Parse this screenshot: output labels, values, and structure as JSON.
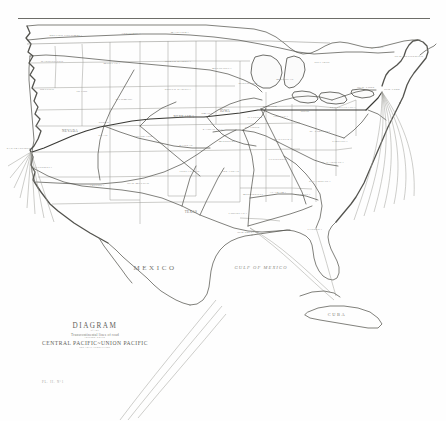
{
  "document": {
    "kind": "scanned-map-plate",
    "top_rule": true
  },
  "title_block": {
    "heading": "DIAGRAM",
    "ornament": "of the",
    "subtitle": "Transcontinental lines of road",
    "ornament2": "through which",
    "roads": "CENTRAL PACIFIC~UNION PACIFIC",
    "footnote": "and their connections"
  },
  "plate_mark": "PL. II. N°1",
  "water_labels": [
    {
      "text": "GULF OF MEXICO",
      "x": 261,
      "y": 269
    },
    {
      "text": "CUBA",
      "x": 337,
      "y": 316
    }
  ],
  "land_labels": [
    {
      "text": "MEXICO",
      "x": 155,
      "y": 270
    }
  ],
  "regions": [
    {
      "name": "BRITISH COLUMBIA",
      "x": 66,
      "y": 36
    },
    {
      "name": "ASSINIBOIA",
      "x": 131,
      "y": 34
    },
    {
      "name": "MANITOBA",
      "x": 180,
      "y": 33
    },
    {
      "name": "ONTARIO",
      "x": 322,
      "y": 63
    },
    {
      "name": "QUEBEC",
      "x": 377,
      "y": 48
    },
    {
      "name": "NEW BRUNSWICK",
      "x": 409,
      "y": 57
    },
    {
      "name": "WASHINGTON",
      "x": 52,
      "y": 62
    },
    {
      "name": "MONTANA",
      "x": 112,
      "y": 64
    },
    {
      "name": "NORTH DAKOTA",
      "x": 178,
      "y": 62
    },
    {
      "name": "MINNESOTA",
      "x": 222,
      "y": 69
    },
    {
      "name": "OREGON",
      "x": 47,
      "y": 90
    },
    {
      "name": "IDAHO",
      "x": 82,
      "y": 92
    },
    {
      "name": "WYOMING",
      "x": 124,
      "y": 100
    },
    {
      "name": "SOUTH DAKOTA",
      "x": 178,
      "y": 90
    },
    {
      "name": "WISCONSIN",
      "x": 248,
      "y": 84
    },
    {
      "name": "MICHIGAN",
      "x": 285,
      "y": 80
    },
    {
      "name": "NEW YORK",
      "x": 366,
      "y": 88
    },
    {
      "name": "NEVADA",
      "x": 70,
      "y": 132
    },
    {
      "name": "UTAH",
      "x": 103,
      "y": 136
    },
    {
      "name": "COLORADO",
      "x": 143,
      "y": 137
    },
    {
      "name": "NEBRASKA",
      "x": 184,
      "y": 118
    },
    {
      "name": "IOWA",
      "x": 225,
      "y": 112
    },
    {
      "name": "ILLINOIS",
      "x": 255,
      "y": 118
    },
    {
      "name": "INDIANA",
      "x": 281,
      "y": 117
    },
    {
      "name": "OHIO",
      "x": 305,
      "y": 112
    },
    {
      "name": "PENNSYLVANIA",
      "x": 343,
      "y": 108
    },
    {
      "name": "CALIFORNIA",
      "x": 42,
      "y": 168
    },
    {
      "name": "KANSAS",
      "x": 186,
      "y": 146
    },
    {
      "name": "MISSOURI",
      "x": 227,
      "y": 142
    },
    {
      "name": "KENTUCKY",
      "x": 283,
      "y": 140
    },
    {
      "name": "W. VIRGINIA",
      "x": 320,
      "y": 132
    },
    {
      "name": "VIRGINIA",
      "x": 340,
      "y": 142
    },
    {
      "name": "ARIZONA",
      "x": 97,
      "y": 186
    },
    {
      "name": "NEW MEXICO",
      "x": 138,
      "y": 184
    },
    {
      "name": "INDIAN TER.",
      "x": 190,
      "y": 172
    },
    {
      "name": "ARKANSAS",
      "x": 230,
      "y": 172
    },
    {
      "name": "TENNESSEE",
      "x": 278,
      "y": 160
    },
    {
      "name": "N. CAROLINA",
      "x": 333,
      "y": 163
    },
    {
      "name": "S. CAROLINA",
      "x": 320,
      "y": 182
    },
    {
      "name": "MISSISSIPPI",
      "x": 253,
      "y": 195
    },
    {
      "name": "ALABAMA",
      "x": 278,
      "y": 193
    },
    {
      "name": "GEORGIA",
      "x": 303,
      "y": 195
    },
    {
      "name": "LOUISIANA",
      "x": 238,
      "y": 214
    },
    {
      "name": "TEXAS",
      "x": 191,
      "y": 213
    },
    {
      "name": "FLORIDA",
      "x": 315,
      "y": 230
    }
  ],
  "cities": [
    {
      "name": "SAN FRANCISCO",
      "x": 31,
      "y": 152
    },
    {
      "name": "OGDEN",
      "x": 104,
      "y": 126
    },
    {
      "name": "OMAHA",
      "x": 207,
      "y": 117
    },
    {
      "name": "CHICAGO",
      "x": 261,
      "y": 109
    },
    {
      "name": "KANSAS CITY",
      "x": 213,
      "y": 132
    },
    {
      "name": "ST. LOUIS",
      "x": 243,
      "y": 130
    },
    {
      "name": "NEW ORLEANS",
      "x": 248,
      "y": 228
    },
    {
      "name": "NEW YORK",
      "x": 368,
      "y": 110
    }
  ]
}
